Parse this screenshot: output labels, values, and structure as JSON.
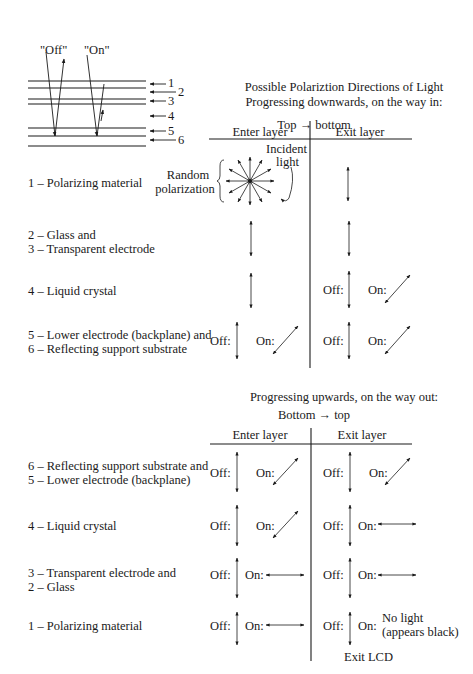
{
  "schematic": {
    "beam_labels": [
      "\"Off\"",
      "\"On\""
    ],
    "layer_numbers": [
      "1",
      "2",
      "3",
      "4",
      "5",
      "6"
    ]
  },
  "top_section": {
    "title_line1": "Possible Polariztion Directions of Light",
    "title_line2": "Progressing downwards, on the way in:",
    "direction": "Top → bottom",
    "col_enter": "Enter layer",
    "col_exit": "Exit layer",
    "incident_line1": "Incident",
    "incident_line2": "light",
    "random_line1": "Random",
    "random_line2": "polarization",
    "rows": [
      {
        "label_lines": [
          "1 – Polarizing material"
        ],
        "enter": "random",
        "exit": "vertical"
      },
      {
        "label_lines": [
          "2 – Glass and",
          "3 – Transparent electrode"
        ],
        "enter": "vertical",
        "exit": "vertical"
      },
      {
        "label_lines": [
          "4 – Liquid crystal"
        ],
        "enter": "vertical",
        "exit": {
          "off": "vertical",
          "on": "diagonal"
        }
      },
      {
        "label_lines": [
          "5 – Lower electrode (backplane) and",
          "6 – Reflecting support substrate"
        ],
        "enter": {
          "off": "vertical",
          "on": "diagonal"
        },
        "exit": {
          "off": "vertical",
          "on": "diagonal"
        }
      }
    ]
  },
  "bottom_section": {
    "title": "Progressing upwards, on the way out:",
    "direction": "Bottom → top",
    "col_enter": "Enter layer",
    "col_exit": "Exit layer",
    "rows": [
      {
        "label_lines": [
          "6 – Reflecting support substrate and",
          "5 – Lower electrode (backplane)"
        ],
        "enter": {
          "off": "vertical",
          "on": "diagonal"
        },
        "exit": {
          "off": "vertical",
          "on": "diagonal"
        }
      },
      {
        "label_lines": [
          "4 – Liquid crystal"
        ],
        "enter": {
          "off": "vertical",
          "on": "diagonal"
        },
        "exit": {
          "off": "vertical",
          "on": "horizontal"
        }
      },
      {
        "label_lines": [
          "3 – Transparent electrode and",
          "2 – Glass"
        ],
        "enter": {
          "off": "vertical",
          "on": "horizontal"
        },
        "exit": {
          "off": "vertical",
          "on": "horizontal"
        }
      },
      {
        "label_lines": [
          "1 – Polarizing material"
        ],
        "enter": {
          "off": "vertical",
          "on": "horizontal"
        },
        "exit": {
          "off": "vertical",
          "on": "none"
        }
      }
    ],
    "no_light_line1": "No light",
    "no_light_line2": "(appears black)",
    "exit_label": "Exit LCD"
  },
  "labels": {
    "off": "Off:",
    "on": "On:"
  }
}
